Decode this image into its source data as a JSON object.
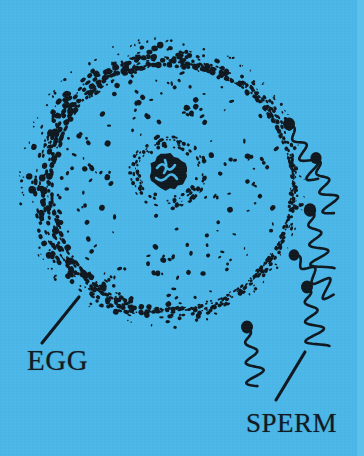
{
  "figure": {
    "background_color": "#4bb7e8",
    "ink_color": "#101820",
    "edge_strip_color": "#62c2ec",
    "width": 364,
    "height": 456
  },
  "labels": {
    "egg": "EGG",
    "sperm": "SPERM"
  },
  "leader_lines": [
    {
      "name": "egg-leader-line",
      "x1": 42,
      "y1": 343,
      "x2": 79,
      "y2": 297
    },
    {
      "name": "sperm-leader-line",
      "x1": 276,
      "y1": 400,
      "x2": 305,
      "y2": 352
    }
  ],
  "egg_cell": {
    "center_x": 162,
    "center_y": 183,
    "radius_x": 137,
    "radius_y": 139,
    "membrane_band_thickness": 17,
    "cytoplasm_dot_count": 210,
    "membrane_dot_count": 900,
    "nucleus": {
      "center_x": 168,
      "center_y": 172,
      "core_radius": 19,
      "halo_radius": 36,
      "halo_dot_count": 120
    }
  },
  "sperm": [
    {
      "name": "sperm-1",
      "head_x": 289,
      "head_y": 124,
      "head_r": 6.0,
      "angle": -118,
      "length": 62,
      "waves": 3.0,
      "amplitude": 9
    },
    {
      "name": "sperm-2",
      "head_x": 316,
      "head_y": 158,
      "head_r": 5.6,
      "angle": -108,
      "length": 58,
      "waves": 3.0,
      "amplitude": 9
    },
    {
      "name": "sperm-3",
      "head_x": 310,
      "head_y": 210,
      "head_r": 6.2,
      "angle": -102,
      "length": 62,
      "waves": 3.2,
      "amplitude": 10
    },
    {
      "name": "sperm-4",
      "head_x": 294,
      "head_y": 255,
      "head_r": 5.4,
      "angle": -135,
      "length": 56,
      "waves": 3.0,
      "amplitude": 9
    },
    {
      "name": "sperm-5",
      "head_x": 307,
      "head_y": 287,
      "head_r": 6.0,
      "angle": -100,
      "length": 62,
      "waves": 3.2,
      "amplitude": 10
    },
    {
      "name": "sperm-6",
      "head_x": 247,
      "head_y": 327,
      "head_r": 6.0,
      "angle": -100,
      "length": 60,
      "waves": 3.0,
      "amplitude": 9
    }
  ]
}
